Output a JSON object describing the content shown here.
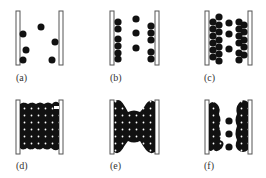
{
  "colors": {
    "particle": "#111111",
    "wall_stroke": "#555555",
    "wall_fill": "#ffffff",
    "label": "#333333"
  },
  "panels": [
    {
      "id": "a",
      "label": "(a)",
      "description": "sparse particles between two walls"
    },
    {
      "id": "b",
      "label": "(b)",
      "description": "particles adsorbing onto walls in single column"
    },
    {
      "id": "c",
      "label": "(c)",
      "description": "multilayer adsorption on walls, middle column sparse"
    },
    {
      "id": "d",
      "label": "(d)",
      "description": "pore completely filled with dense particles"
    },
    {
      "id": "e",
      "label": "(e)",
      "description": "partially emptied pore with hourglass shape"
    },
    {
      "id": "f",
      "label": "(f)",
      "description": "desorption leaving wall layers and sparse middle column"
    }
  ]
}
